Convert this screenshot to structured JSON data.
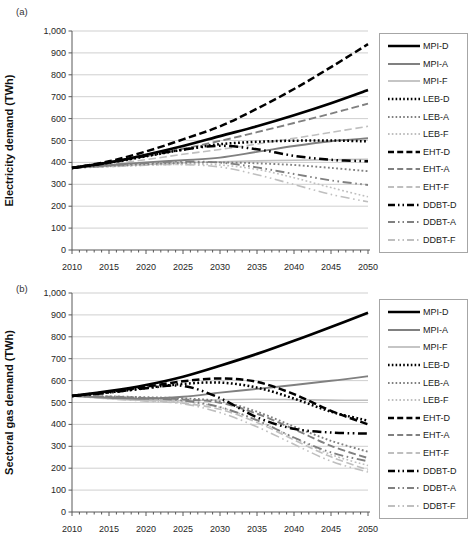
{
  "colors": {
    "black": "#000000",
    "gray": "#808080",
    "lightgray": "#bfbfbf",
    "gridline": "#c9c9c9",
    "axis": "#595959",
    "tick_text": "#262626"
  },
  "chart_data": [
    {
      "type": "line",
      "panel_label": "(a)",
      "ylabel": "Electricity demand (TWh)",
      "xlabel": "",
      "x": [
        2010,
        2015,
        2020,
        2025,
        2030,
        2035,
        2040,
        2045,
        2050
      ],
      "x_tick_labels": [
        "2010",
        "2015",
        "2020",
        "2025",
        "2030",
        "2035",
        "2040",
        "2045",
        "2050"
      ],
      "y_tick_labels": [
        "0",
        "100",
        "200",
        "300",
        "400",
        "500",
        "600",
        "700",
        "800",
        "900",
        "1,000"
      ],
      "ylim": [
        0,
        1000
      ],
      "grid": "horizontal",
      "legend_position": "right",
      "series": [
        {
          "name": "MPI-D",
          "color": "black",
          "style": "solid",
          "values": [
            375,
            400,
            435,
            475,
            520,
            565,
            615,
            670,
            730
          ]
        },
        {
          "name": "MPI-A",
          "color": "gray",
          "style": "solid",
          "values": [
            375,
            387,
            400,
            410,
            422,
            448,
            475,
            497,
            510
          ]
        },
        {
          "name": "MPI-F",
          "color": "lightgray",
          "style": "solid",
          "values": [
            375,
            383,
            391,
            398,
            403,
            407,
            410,
            412,
            414
          ]
        },
        {
          "name": "LEB-D",
          "color": "black",
          "style": "dotted",
          "values": [
            375,
            398,
            428,
            458,
            483,
            494,
            499,
            500,
            496
          ]
        },
        {
          "name": "LEB-A",
          "color": "gray",
          "style": "dotted",
          "values": [
            375,
            384,
            392,
            398,
            400,
            396,
            388,
            375,
            360
          ]
        },
        {
          "name": "LEB-F",
          "color": "lightgray",
          "style": "dotted",
          "values": [
            375,
            381,
            387,
            391,
            388,
            368,
            330,
            285,
            243
          ]
        },
        {
          "name": "EHT-D",
          "color": "black",
          "style": "dashed",
          "values": [
            375,
            405,
            450,
            505,
            565,
            645,
            735,
            835,
            940
          ]
        },
        {
          "name": "EHT-A",
          "color": "gray",
          "style": "dashed",
          "values": [
            375,
            398,
            428,
            462,
            498,
            538,
            580,
            623,
            668
          ]
        },
        {
          "name": "EHT-F",
          "color": "lightgray",
          "style": "dashed",
          "values": [
            375,
            391,
            413,
            437,
            459,
            484,
            510,
            537,
            565
          ]
        },
        {
          "name": "DDBT-D",
          "color": "black",
          "style": "dashdotdot",
          "values": [
            375,
            399,
            430,
            458,
            476,
            460,
            430,
            412,
            405
          ]
        },
        {
          "name": "DDBT-A",
          "color": "gray",
          "style": "dashdotdot",
          "values": [
            375,
            386,
            397,
            404,
            399,
            377,
            347,
            318,
            297
          ]
        },
        {
          "name": "DDBT-F",
          "color": "lightgray",
          "style": "dashdotdot",
          "values": [
            375,
            380,
            387,
            390,
            379,
            344,
            299,
            254,
            220
          ]
        }
      ]
    },
    {
      "type": "line",
      "panel_label": "(b)",
      "ylabel": "Sectoral gas demand (TWh)",
      "xlabel": "",
      "x": [
        2010,
        2015,
        2020,
        2025,
        2030,
        2035,
        2040,
        2045,
        2050
      ],
      "x_tick_labels": [
        "2010",
        "2015",
        "2020",
        "2025",
        "2030",
        "2035",
        "2040",
        "2045",
        "2050"
      ],
      "y_tick_labels": [
        "0",
        "100",
        "200",
        "300",
        "400",
        "500",
        "600",
        "700",
        "800",
        "900",
        "1,000"
      ],
      "ylim": [
        0,
        1000
      ],
      "grid": "horizontal",
      "legend_position": "right",
      "series": [
        {
          "name": "MPI-D",
          "color": "black",
          "style": "solid",
          "values": [
            530,
            552,
            580,
            618,
            668,
            722,
            782,
            845,
            910
          ]
        },
        {
          "name": "MPI-A",
          "color": "gray",
          "style": "solid",
          "values": [
            530,
            522,
            517,
            526,
            545,
            562,
            580,
            599,
            620
          ]
        },
        {
          "name": "MPI-F",
          "color": "lightgray",
          "style": "solid",
          "values": [
            530,
            518,
            510,
            508,
            513,
            515,
            513,
            511,
            510
          ]
        },
        {
          "name": "LEB-D",
          "color": "black",
          "style": "dotted",
          "values": [
            530,
            546,
            566,
            585,
            591,
            568,
            518,
            458,
            417
          ]
        },
        {
          "name": "LEB-A",
          "color": "gray",
          "style": "dotted",
          "values": [
            530,
            528,
            524,
            519,
            505,
            458,
            390,
            325,
            275
          ]
        },
        {
          "name": "LEB-F",
          "color": "lightgray",
          "style": "dotted",
          "values": [
            530,
            520,
            512,
            504,
            478,
            418,
            338,
            262,
            212
          ]
        },
        {
          "name": "EHT-D",
          "color": "black",
          "style": "dashed",
          "values": [
            530,
            549,
            572,
            597,
            610,
            594,
            538,
            462,
            400
          ]
        },
        {
          "name": "EHT-A",
          "color": "gray",
          "style": "dashed",
          "values": [
            530,
            527,
            521,
            514,
            499,
            449,
            378,
            302,
            246
          ]
        },
        {
          "name": "EHT-F",
          "color": "lightgray",
          "style": "dashed",
          "values": [
            530,
            519,
            509,
            497,
            469,
            409,
            329,
            252,
            192
          ]
        },
        {
          "name": "DDBT-D",
          "color": "black",
          "style": "dashdotdot",
          "values": [
            530,
            545,
            565,
            576,
            520,
            432,
            380,
            363,
            358
          ]
        },
        {
          "name": "DDBT-A",
          "color": "gray",
          "style": "dashdotdot",
          "values": [
            530,
            525,
            519,
            509,
            479,
            419,
            340,
            272,
            231
          ]
        },
        {
          "name": "DDBT-F",
          "color": "lightgray",
          "style": "dashdotdot",
          "values": [
            530,
            517,
            506,
            494,
            454,
            389,
            309,
            232,
            182
          ]
        }
      ]
    }
  ]
}
